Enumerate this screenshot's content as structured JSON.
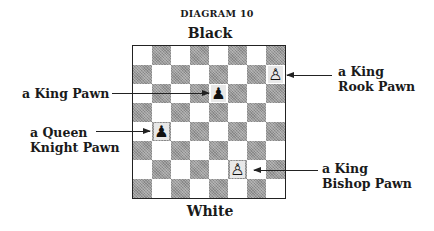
{
  "diagram": {
    "title": "DIAGRAM 10",
    "top_side": "Black",
    "bottom_side": "White"
  },
  "board": {
    "files": [
      "a",
      "b",
      "c",
      "d",
      "e",
      "f",
      "g",
      "h"
    ],
    "ranks": [
      8,
      7,
      6,
      5,
      4,
      3,
      2,
      1
    ],
    "light_color": "#ffffff",
    "dark_color": "#9a9a9a",
    "pieces": [
      {
        "square": "h7",
        "color": "white",
        "type": "pawn",
        "glyph": "♙",
        "name": "king-rook-pawn"
      },
      {
        "square": "e6",
        "color": "black",
        "type": "pawn",
        "glyph": "♟",
        "name": "king-pawn"
      },
      {
        "square": "b4",
        "color": "black",
        "type": "pawn",
        "glyph": "♟",
        "name": "queen-knight-pawn"
      },
      {
        "square": "f2",
        "color": "white",
        "type": "pawn",
        "glyph": "♙",
        "name": "king-bishop-pawn"
      }
    ]
  },
  "annotations": {
    "king_pawn": {
      "line1": "a King Pawn",
      "line2": ""
    },
    "queen_knight_pawn": {
      "line1": "a Queen",
      "line2": "Knight Pawn"
    },
    "king_rook_pawn": {
      "line1": "a King",
      "line2": "Rook Pawn"
    },
    "king_bishop_pawn": {
      "line1": "a King",
      "line2": "Bishop Pawn"
    }
  }
}
